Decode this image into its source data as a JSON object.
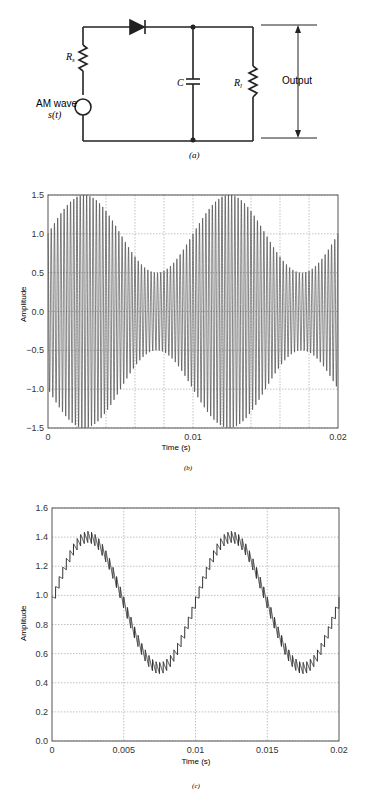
{
  "circuit": {
    "source_label_line1": "AM wave",
    "source_label_line2": "s(t)",
    "rs_label": "R",
    "rs_sub": "s",
    "c_label": "C",
    "rl_label": "R",
    "rl_sub": "l",
    "output_label": "Output",
    "caption": "(a)"
  },
  "plot_b": {
    "caption": "(b)",
    "xlabel": "Time (s)",
    "ylabel": "Amplitude",
    "yticks": [
      "1.5",
      "1.0",
      "0.5",
      "0.0",
      "-0.5",
      "-1.0",
      "-1.5"
    ],
    "xticks": [
      "0",
      "0.01",
      "0.02"
    ]
  },
  "plot_c": {
    "caption": "(c)",
    "xlabel": "Time (s)",
    "ylabel": "Amplitude",
    "yticks": [
      "1.6",
      "1.4",
      "1.2",
      "1.0",
      "0.8",
      "0.6",
      "0.4",
      "0.2",
      "0.0"
    ],
    "xticks": [
      "0",
      "0.005",
      "0.01",
      "0.015",
      "0.02"
    ]
  },
  "chart_data": [
    {
      "type": "line",
      "title": "AM wave input (b)",
      "xlabel": "Time (s)",
      "ylabel": "Amplitude",
      "xlim": [
        0,
        0.02
      ],
      "ylim": [
        -1.5,
        1.5
      ],
      "grid": true,
      "series": [
        {
          "name": "s(t) = [1 + 0.5 sin(2π·100t)] cos(2π·fc t)",
          "envelope_max": 1.5,
          "envelope_min": 0.5,
          "modulation_freq_hz": 100,
          "x": [
            0,
            0.0025,
            0.005,
            0.0075,
            0.01,
            0.0125,
            0.015,
            0.0175,
            0.02
          ],
          "upper_envelope": [
            1.0,
            1.5,
            1.0,
            0.5,
            1.0,
            1.5,
            1.0,
            0.5,
            1.0
          ]
        }
      ]
    },
    {
      "type": "line",
      "title": "Envelope detector output (c)",
      "xlabel": "Time (s)",
      "ylabel": "Amplitude",
      "xlim": [
        0,
        0.02
      ],
      "ylim": [
        0,
        1.6
      ],
      "grid": true,
      "series": [
        {
          "name": "output",
          "x": [
            0,
            0.0025,
            0.005,
            0.0075,
            0.01,
            0.0125,
            0.015,
            0.0175,
            0.02
          ],
          "values": [
            0.9,
            1.4,
            0.95,
            0.5,
            0.95,
            1.4,
            0.95,
            0.5,
            0.9
          ],
          "ripple": 0.08
        }
      ]
    }
  ]
}
